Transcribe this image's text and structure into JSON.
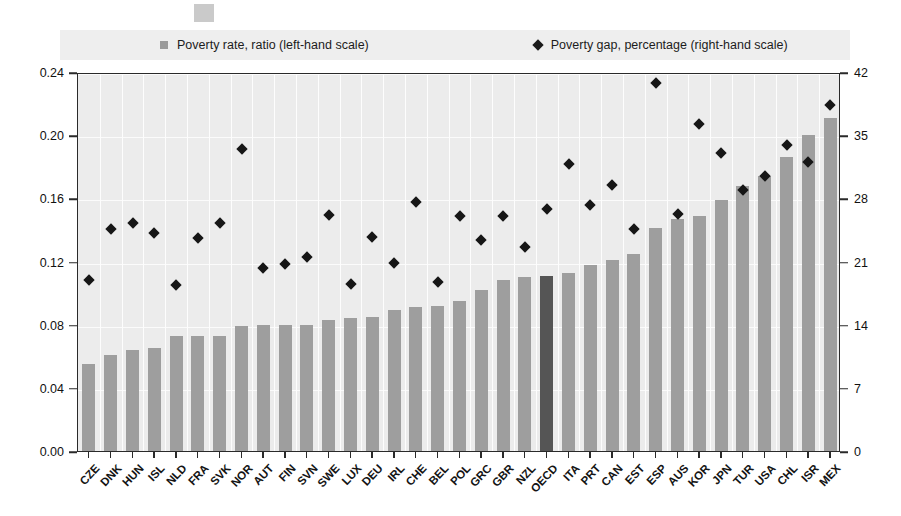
{
  "legend": {
    "series1_label": "Poverty rate, ratio (left-hand scale)",
    "series1_marker": "square-swatch-icon",
    "series2_label": "Poverty gap, percentage (right-hand scale)",
    "series2_marker": "diamond-marker-icon"
  },
  "axes": {
    "left_ticks": [
      "0.24",
      "0.20",
      "0.16",
      "0.12",
      "0.08",
      "0.04",
      "0.00"
    ],
    "right_ticks": [
      "42",
      "35",
      "28",
      "21",
      "14",
      "7",
      "0"
    ]
  },
  "colors": {
    "bar": "#9e9e9e",
    "bar_highlight": "#555555",
    "diamond": "#161616",
    "plot_background": "#ececec",
    "legend_background": "#eeeeee",
    "axis": "#2a2a2a"
  },
  "chart_data": {
    "type": "bar",
    "title": "",
    "subtitle": "",
    "xlabel": "",
    "ylabel": "Poverty rate, ratio",
    "ylabel_right": "Poverty gap, percentage",
    "ylim": [
      0,
      0.24
    ],
    "ylim_right": [
      0,
      42
    ],
    "grid": true,
    "legend_position": "top",
    "categories": [
      "CZE",
      "DNK",
      "HUN",
      "ISL",
      "NLD",
      "FRA",
      "SVK",
      "NOR",
      "AUT",
      "FIN",
      "SVN",
      "SWE",
      "LUX",
      "DEU",
      "IRL",
      "CHE",
      "BEL",
      "POL",
      "GRC",
      "GBR",
      "NZL",
      "OECD",
      "ITA",
      "PRT",
      "CAN",
      "EST",
      "ESP",
      "AUS",
      "KOR",
      "JPN",
      "TUR",
      "USA",
      "CHL",
      "ISR",
      "MEX"
    ],
    "series": [
      {
        "name": "Poverty rate, ratio (left-hand scale)",
        "axis": "left",
        "type": "bar",
        "values": [
          0.055,
          0.061,
          0.064,
          0.065,
          0.073,
          0.073,
          0.073,
          0.079,
          0.08,
          0.08,
          0.08,
          0.083,
          0.084,
          0.085,
          0.089,
          0.091,
          0.092,
          0.095,
          0.102,
          0.108,
          0.11,
          0.111,
          0.113,
          0.118,
          0.121,
          0.125,
          0.141,
          0.147,
          0.149,
          0.159,
          0.168,
          0.174,
          0.186,
          0.2,
          0.211
        ],
        "highlight_index": 21
      },
      {
        "name": "Poverty gap, percentage (right-hand scale)",
        "axis": "right",
        "type": "scatter",
        "marker": "diamond",
        "values": [
          19.4,
          25.0,
          25.7,
          24.6,
          18.8,
          24.0,
          25.7,
          33.9,
          20.7,
          21.2,
          21.9,
          26.6,
          19.0,
          24.2,
          21.3,
          28.0,
          19.2,
          26.5,
          23.8,
          26.5,
          23.0,
          27.3,
          32.3,
          27.7,
          29.9,
          25.1,
          41.2,
          26.7,
          36.7,
          33.5,
          29.4,
          30.9,
          34.4,
          32.5,
          38.8
        ]
      }
    ]
  }
}
